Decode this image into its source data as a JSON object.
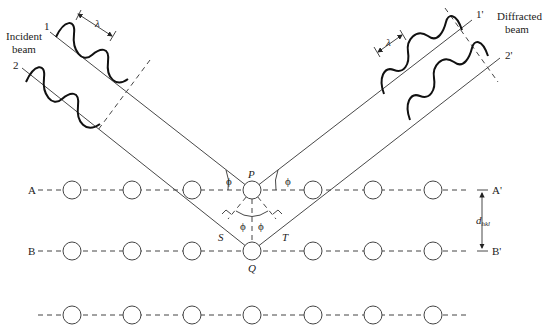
{
  "diagram": {
    "type": "Bragg diffraction geometry",
    "labels": {
      "incident_beam": [
        "Incident",
        "beam"
      ],
      "diffracted_beam": [
        "Diffracted",
        "beam"
      ],
      "ray_1": "1",
      "ray_2": "2",
      "ray_1_prime": "1'",
      "ray_2_prime": "2'",
      "wavelength": "λ",
      "point_p": "P",
      "point_q": "Q",
      "point_s": "S",
      "point_t": "T",
      "angle": "ϕ",
      "plane_a": "A",
      "plane_a_prime": "A'",
      "plane_b": "B",
      "plane_b_prime": "B'",
      "spacing_d": "d",
      "spacing_subscript": "hkl"
    },
    "planes": [
      {
        "name": "A-A'",
        "y": 190
      },
      {
        "name": "B-B'",
        "y": 251
      },
      {
        "name": "third",
        "y": 315
      }
    ],
    "atom_x_positions": [
      72,
      132,
      192,
      252,
      313,
      373,
      433
    ],
    "atom_radius": 9
  }
}
